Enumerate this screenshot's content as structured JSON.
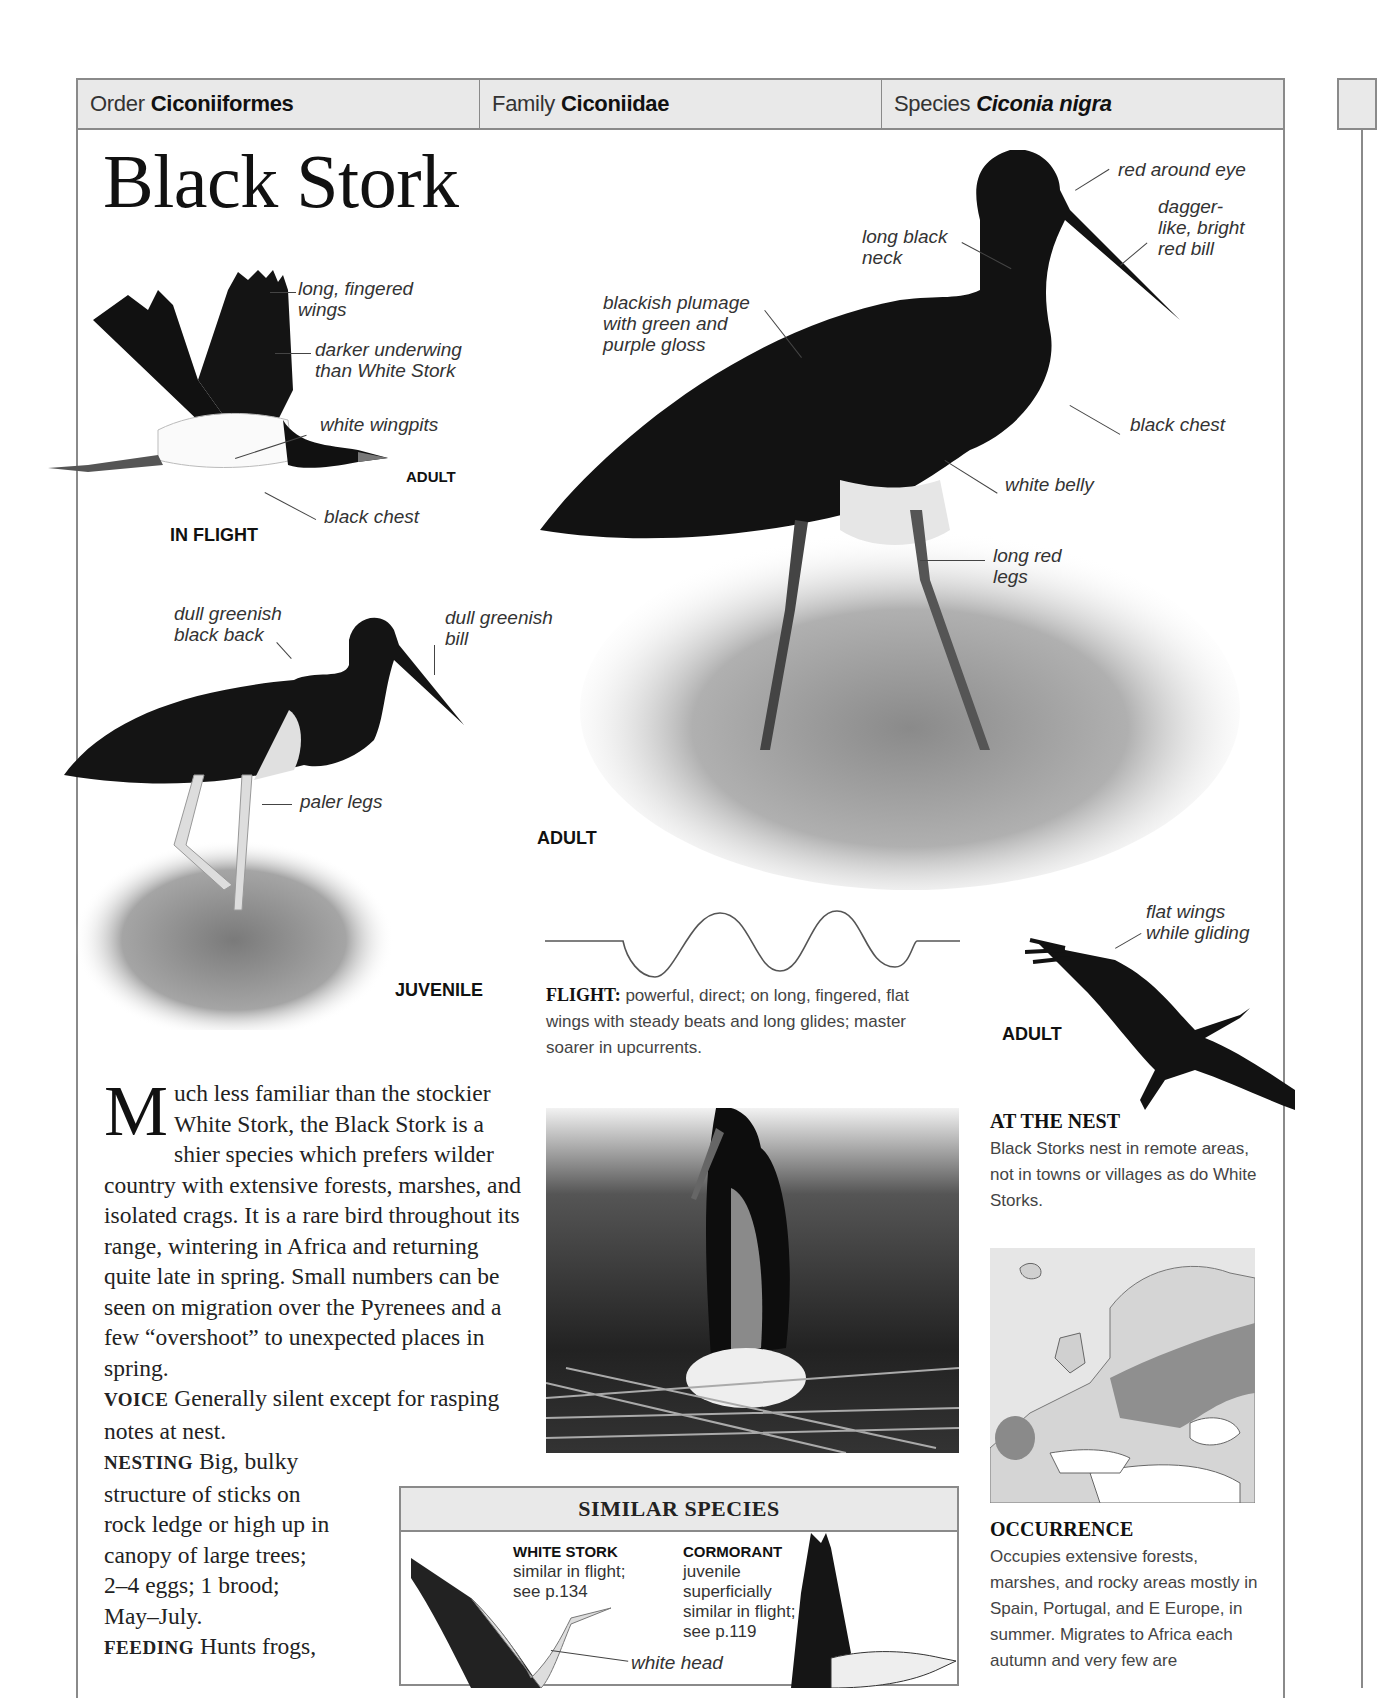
{
  "header": {
    "order_label": "Order",
    "order_value": "Ciconiiformes",
    "family_label": "Family",
    "family_value": "Ciconiidae",
    "species_label": "Species",
    "species_value": "Ciconia nigra"
  },
  "title": "Black Stork",
  "in_flight": {
    "caption": "IN FLIGHT",
    "age": "ADULT",
    "labels": [
      "long, fingered\nwings",
      "darker underwing\nthan White Stork",
      "white wingpits",
      "black chest"
    ]
  },
  "adult_standing": {
    "caption": "ADULT",
    "labels": [
      "red around eye",
      "dagger-\nlike, bright\nred bill",
      "long black\nneck",
      "blackish plumage\nwith green and\npurple gloss",
      "black chest",
      "white belly",
      "long red\nlegs"
    ]
  },
  "juvenile": {
    "caption": "JUVENILE",
    "labels": [
      "dull greenish\nblack back",
      "dull greenish\nbill",
      "paler legs"
    ]
  },
  "flight_pattern": {
    "heading": "FLIGHT:",
    "text": "powerful, direct; on long, fingered, flat wings with steady beats and long glides; master soarer in upcurrents."
  },
  "gliding": {
    "caption": "ADULT",
    "label": "flat wings\nwhile gliding"
  },
  "description": {
    "dropcap": "M",
    "intro": "uch less familiar than the stockier White Stork, the Black Stork is a shier species which prefers wilder country with extensive forests, marshes, and isolated crags. It is a rare bird throughout its range, wintering in Africa and returning quite late in spring. Small numbers can be seen on migration over the Pyrenees and a few “overshoot” to unexpected places in spring.",
    "voice_label": "VOICE",
    "voice_text": "Generally silent except for rasping notes at nest.",
    "nesting_label": "NESTING",
    "nesting_text": "Big, bulky structure of sticks on rock ledge or high up in canopy of large trees; 2–4 eggs; 1 brood; May–July.",
    "feeding_label": "FEEDING",
    "feeding_text": "Hunts frogs,"
  },
  "at_the_nest": {
    "heading": "AT THE NEST",
    "text": "Black Storks nest in remote areas, not in towns or villages as do White Storks."
  },
  "occurrence": {
    "heading": "OCCURRENCE",
    "text": "Occupies extensive forests, marshes, and rocky areas mostly in Spain, Portugal, and E Europe, in summer. Migrates to Africa each autumn and very few are"
  },
  "similar_species": {
    "heading": "SIMILAR SPECIES",
    "items": [
      {
        "name": "WHITE STORK",
        "text": "similar in flight; see p.134"
      },
      {
        "name": "CORMORANT",
        "text": "juvenile superficially similar in flight; see p.119"
      }
    ],
    "label": "white head"
  },
  "colors": {
    "header_bg": "#e9e9e9",
    "border": "#8a8a8a",
    "text": "#222222"
  }
}
